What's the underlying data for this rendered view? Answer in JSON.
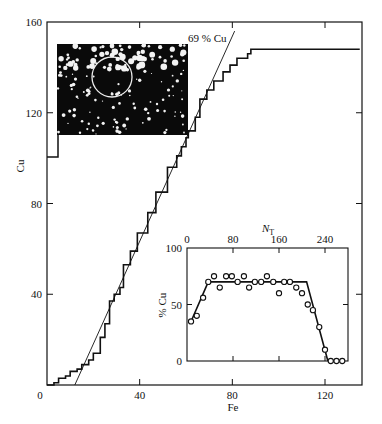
{
  "chart_data": [
    {
      "type": "line",
      "title": "",
      "xlabel": "Fe",
      "ylabel": "Cu",
      "xlim": [
        0,
        136
      ],
      "ylim": [
        0,
        160
      ],
      "xticks": [
        0,
        40,
        80,
        120
      ],
      "yticks": [
        0,
        40,
        80,
        120,
        160
      ],
      "grid": false,
      "legend": null,
      "series": [
        {
          "name": "cumulative Cu vs Fe (staircase)",
          "style": "step",
          "x": [
            0,
            3,
            5,
            8,
            10,
            13,
            15,
            18,
            20,
            23,
            25,
            27,
            29,
            31.5,
            33,
            36,
            39,
            43.5,
            47,
            52,
            56,
            58,
            60,
            61,
            64,
            66,
            69,
            72,
            76,
            79,
            82,
            86.6,
            88,
            92,
            135
          ],
          "y": [
            0,
            1,
            3,
            4,
            6,
            7,
            9,
            11,
            14,
            21,
            27,
            37,
            40,
            43,
            53,
            59,
            67,
            76,
            85,
            96,
            101,
            105,
            109,
            112,
            118,
            126,
            130,
            134,
            138,
            141,
            144,
            146,
            148,
            148,
            148
          ]
        },
        {
          "name": "69 % Cu",
          "style": "line",
          "x": [
            12,
            81
          ],
          "y": [
            0,
            156
          ]
        }
      ],
      "annotations": [
        {
          "text": "69 % Cu",
          "x": 68,
          "y": 152
        },
        {
          "text": "micrograph inset (field-ion image with circled region)",
          "x_range": [
            4,
            61
          ],
          "y_range": [
            110,
            150
          ]
        }
      ]
    },
    {
      "type": "scatter",
      "title": "",
      "xlabel": "N_T",
      "ylabel": "% Cu",
      "xlim": [
        0,
        280
      ],
      "ylim": [
        0,
        100
      ],
      "xticks": [
        0,
        80,
        160,
        240
      ],
      "yticks": [
        0,
        50,
        100
      ],
      "x_axis_position": "top",
      "grid": false,
      "series": [
        {
          "name": "measured",
          "style": "markers-open-circle",
          "x": [
            7,
            17,
            28,
            37,
            47,
            57,
            68,
            78,
            88,
            99,
            108,
            118,
            129,
            139,
            150,
            160,
            169,
            179,
            190,
            200,
            210,
            219,
            230,
            240,
            250,
            260,
            270
          ],
          "y": [
            35,
            40,
            56,
            70,
            75,
            65,
            75,
            75,
            70,
            75,
            65,
            70,
            70,
            75,
            70,
            60,
            70,
            70,
            65,
            60,
            50,
            45,
            30,
            10,
            0,
            0,
            0
          ]
        },
        {
          "name": "fit",
          "style": "line",
          "x": [
            7,
            37,
            208,
            245
          ],
          "y": [
            35,
            70,
            70,
            0
          ]
        }
      ]
    }
  ],
  "main": {
    "xlabel": "Fe",
    "ylabel": "Cu",
    "xticks": [
      "0",
      "40",
      "80",
      "120"
    ],
    "yticks": [
      "0",
      "40",
      "80",
      "120",
      "160"
    ],
    "annotation": "69 % Cu"
  },
  "inset": {
    "xlabel_main": "N",
    "xlabel_sub": "T",
    "ylabel": "% Cu",
    "xticks": [
      "0",
      "80",
      "160",
      "240"
    ],
    "yticks": [
      "0",
      "50",
      "100"
    ]
  },
  "colors": {
    "ink": "#111111",
    "background": "#ffffff"
  }
}
